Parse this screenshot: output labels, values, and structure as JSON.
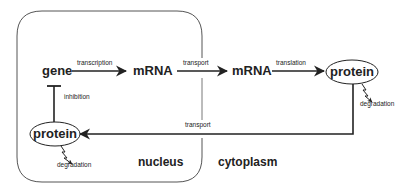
{
  "diagram": {
    "regions": {
      "nucleus": "nucleus",
      "cytoplasm": "cytoplasm"
    },
    "nodes": {
      "gene": "gene",
      "mrna_nuclear": "mRNA",
      "mrna_cytoplasmic": "mRNA",
      "protein_cytoplasmic": "protein",
      "protein_nuclear": "protein"
    },
    "edges": {
      "transcription": "transcription",
      "transport_mrna": "transport",
      "translation": "translation",
      "transport_protein": "transport",
      "inhibition": "inhibition",
      "degradation_cytoplasmic": "degradation",
      "degradation_nuclear": "degradation"
    },
    "colors": {
      "stroke": "#222222",
      "box": "#555555",
      "background": "#ffffff"
    }
  }
}
